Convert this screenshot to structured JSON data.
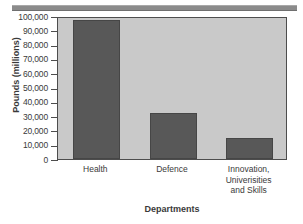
{
  "chart_data": {
    "type": "bar",
    "title": "",
    "categories": [
      "Health",
      "Defence",
      "Innovation, Univerisities and Skills"
    ],
    "category_lines": [
      [
        "Health"
      ],
      [
        "Defence"
      ],
      [
        "Innovation,",
        "Univerisities",
        "and Skills"
      ]
    ],
    "values": [
      97000,
      32500,
      15000
    ],
    "xlabel": "Departments",
    "ylabel": "Pounds (millions)",
    "ylim": [
      0,
      100000
    ],
    "ytick_values": [
      0,
      10000,
      20000,
      30000,
      40000,
      50000,
      60000,
      70000,
      80000,
      90000,
      100000
    ],
    "ytick_labels": [
      "0",
      "10,000",
      "20,000",
      "30,000",
      "40,000",
      "50,000",
      "60,000",
      "70,000",
      "80,000",
      "90,000",
      "100,000"
    ],
    "grid": false,
    "legend": null,
    "colors": {
      "bar_fill": "#585858",
      "bar_edge": "#464646",
      "plot_background": "#c9c9c9",
      "axis_frame": "#4d4d4d",
      "text": "#3a3a3a",
      "top_rule": "#8b8b8b",
      "page_background": "#ffffff"
    }
  }
}
